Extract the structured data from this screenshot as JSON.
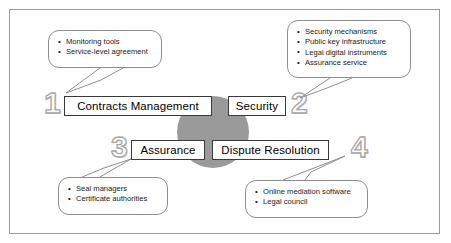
{
  "diagram": {
    "hub": {
      "name": "center-hub",
      "color": "#9a9a9a"
    },
    "frame_color": "#9a9a9a",
    "pillars": [
      {
        "number": "1",
        "label": "Contracts Management"
      },
      {
        "number": "2",
        "label": "Security"
      },
      {
        "number": "3",
        "label": "Assurance"
      },
      {
        "number": "4",
        "label": "Dispute Resolution"
      }
    ],
    "callouts": [
      {
        "for_number": "1",
        "items": [
          "Monitoring tools",
          "Service-level agreement"
        ]
      },
      {
        "for_number": "2",
        "items": [
          "Security mechanisms",
          "Public key infrastructure",
          "Legal digital instruments",
          "Assurance service"
        ]
      },
      {
        "for_number": "3",
        "items": [
          "Seal managers",
          "Certificate authorities"
        ]
      },
      {
        "for_number": "4",
        "items": [
          "Online mediation software",
          "Legal council"
        ]
      }
    ]
  }
}
